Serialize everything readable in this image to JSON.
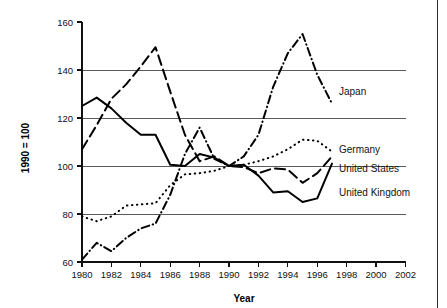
{
  "chart_data": {
    "type": "line",
    "title": "",
    "xlabel": "Year",
    "ylabel": "1990 = 100",
    "xlim": [
      1980,
      2002
    ],
    "ylim": [
      60,
      160
    ],
    "xticks": [
      1980,
      1982,
      1984,
      1986,
      1988,
      1990,
      1992,
      1994,
      1996,
      1998,
      2000,
      2002
    ],
    "yticks": [
      60,
      80,
      100,
      120,
      140,
      160
    ],
    "xtick_labels": [
      "1980",
      "1982",
      "1984",
      "1986",
      "1988",
      "1990",
      "1992",
      "1994",
      "1996",
      "1998",
      "2000",
      "2002"
    ],
    "ytick_labels": [
      "60",
      "80",
      "100",
      "120",
      "140",
      "160"
    ],
    "grid": "horizontal",
    "gridlines_at": [
      80,
      100,
      120,
      140
    ],
    "legend_position": "right-inline",
    "x": [
      1980,
      1981,
      1982,
      1983,
      1984,
      1985,
      1986,
      1987,
      1988,
      1989,
      1990,
      1991,
      1992,
      1993,
      1994,
      1995,
      1996,
      1997
    ],
    "series": [
      {
        "name": "Japan",
        "label": "Japan",
        "line_style": "dash-dot",
        "color": "#000000",
        "values": [
          61,
          68,
          64.5,
          70,
          74,
          76,
          88,
          105,
          116,
          103,
          100,
          104,
          113,
          133,
          147,
          155,
          138,
          126
        ]
      },
      {
        "name": "Germany",
        "label": "Germany",
        "line_style": "dotted",
        "color": "#000000",
        "values": [
          79,
          77,
          79,
          83.5,
          84,
          84.5,
          92,
          96.5,
          97,
          98,
          100,
          100.5,
          102,
          104,
          107,
          111,
          110.5,
          106
        ]
      },
      {
        "name": "United States",
        "label": "United States",
        "line_style": "dashed",
        "color": "#000000",
        "values": [
          107,
          117,
          128,
          134,
          141.5,
          149.5,
          131,
          113,
          102,
          104,
          100,
          99.5,
          97,
          99,
          98.5,
          93,
          97,
          104
        ]
      },
      {
        "name": "United Kingdom",
        "label": "United Kingdom",
        "line_style": "solid",
        "color": "#000000",
        "values": [
          125,
          128.5,
          124,
          118,
          113,
          113,
          100.5,
          100,
          105,
          103.5,
          100,
          100.5,
          96,
          89,
          89.5,
          85,
          86.5,
          101
        ]
      }
    ],
    "series_labels_inline": [
      {
        "text": "Japan",
        "value": 131
      },
      {
        "text": "Germany",
        "value": 107
      },
      {
        "text": "United States",
        "value": 99
      },
      {
        "text": "United Kingdom",
        "value": 89
      }
    ]
  }
}
